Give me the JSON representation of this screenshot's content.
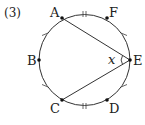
{
  "problem": {
    "number_label": "(3)"
  },
  "diagram": {
    "type": "circle with inscribed angle",
    "points": [
      {
        "name": "A",
        "label": "A"
      },
      {
        "name": "B",
        "label": "B"
      },
      {
        "name": "C",
        "label": "C"
      },
      {
        "name": "D",
        "label": "D"
      },
      {
        "name": "E",
        "label": "E"
      },
      {
        "name": "F",
        "label": "F"
      }
    ],
    "segments": [
      "AE",
      "CE"
    ],
    "angle_label": "x",
    "angle_at": "E",
    "equal_arc_marks": {
      "single_tick_arcs": [
        "AB",
        "BC",
        "FE",
        "ED"
      ],
      "double_tick_arcs": [
        "AF",
        "CD"
      ]
    },
    "stroke_color": "#333333"
  }
}
